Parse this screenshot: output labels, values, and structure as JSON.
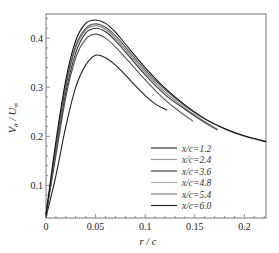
{
  "chart_data": {
    "type": "line",
    "title": "",
    "xlabel": "r / c",
    "ylabel": "V_θ / U_∞",
    "xlim": [
      0,
      0.222
    ],
    "ylim": [
      0.033,
      0.449
    ],
    "xticks": [
      0,
      0.05,
      0.1,
      0.15,
      0.2
    ],
    "xtick_labels": [
      "0",
      "0.05",
      "0.1",
      "0.15",
      "0.2"
    ],
    "yticks": [
      0.1,
      0.2,
      0.3,
      0.4
    ],
    "ytick_labels": [
      "0.1",
      "0.2",
      "0.3",
      "0.4"
    ],
    "grid": false,
    "legend_position": "lower right",
    "series": [
      {
        "name": "x/c=1.2",
        "color": "#222222",
        "x": [
          0,
          0.01,
          0.02,
          0.03,
          0.04,
          0.05,
          0.06,
          0.07,
          0.08,
          0.09,
          0.1,
          0.11,
          0.122
        ],
        "y": [
          0.035,
          0.12,
          0.22,
          0.3,
          0.345,
          0.365,
          0.36,
          0.345,
          0.325,
          0.303,
          0.283,
          0.266,
          0.253
        ]
      },
      {
        "name": "x/c=2.4",
        "color": "#555555",
        "x": [
          0,
          0.01,
          0.02,
          0.03,
          0.04,
          0.05,
          0.06,
          0.07,
          0.08,
          0.1,
          0.12,
          0.135,
          0.148
        ],
        "y": [
          0.04,
          0.16,
          0.28,
          0.36,
          0.398,
          0.408,
          0.4,
          0.382,
          0.36,
          0.315,
          0.274,
          0.25,
          0.231
        ]
      },
      {
        "name": "x/c=3.6",
        "color": "#333333",
        "x": [
          0,
          0.01,
          0.02,
          0.03,
          0.04,
          0.05,
          0.06,
          0.07,
          0.08,
          0.1,
          0.12,
          0.14,
          0.16,
          0.173
        ],
        "y": [
          0.04,
          0.17,
          0.29,
          0.37,
          0.41,
          0.42,
          0.413,
          0.395,
          0.372,
          0.325,
          0.285,
          0.255,
          0.228,
          0.213
        ]
      },
      {
        "name": "x/c=4.8",
        "color": "#777777",
        "x": [
          0,
          0.01,
          0.02,
          0.03,
          0.04,
          0.05,
          0.06,
          0.07,
          0.08,
          0.1,
          0.12,
          0.14,
          0.16,
          0.173
        ],
        "y": [
          0.04,
          0.175,
          0.3,
          0.38,
          0.416,
          0.425,
          0.418,
          0.4,
          0.377,
          0.33,
          0.29,
          0.258,
          0.23,
          0.214
        ]
      },
      {
        "name": "x/c=5.4",
        "color": "#555555",
        "x": [
          0,
          0.01,
          0.02,
          0.03,
          0.04,
          0.05,
          0.06,
          0.07,
          0.08,
          0.1,
          0.12,
          0.14,
          0.16,
          0.18,
          0.2,
          0.222
        ],
        "y": [
          0.04,
          0.18,
          0.305,
          0.385,
          0.42,
          0.429,
          0.422,
          0.405,
          0.382,
          0.335,
          0.295,
          0.262,
          0.235,
          0.215,
          0.2,
          0.189
        ]
      },
      {
        "name": "x/c=6.0",
        "color": "#111111",
        "x": [
          0,
          0.01,
          0.02,
          0.03,
          0.04,
          0.05,
          0.06,
          0.07,
          0.08,
          0.1,
          0.12,
          0.14,
          0.16,
          0.18,
          0.2,
          0.222
        ],
        "y": [
          0.04,
          0.19,
          0.315,
          0.395,
          0.43,
          0.437,
          0.43,
          0.412,
          0.388,
          0.34,
          0.298,
          0.264,
          0.236,
          0.216,
          0.201,
          0.189
        ]
      }
    ]
  },
  "layout": {
    "plot_left": 46,
    "plot_right": 266,
    "plot_top": 14,
    "plot_bottom": 218,
    "y0_pixel": 234.5,
    "y_per_unit": 491,
    "x_per_unit": 992
  }
}
